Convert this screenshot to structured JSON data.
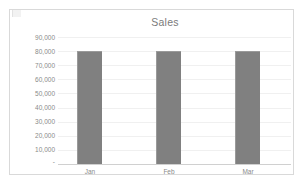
{
  "chart_data": {
    "type": "bar",
    "title": "Sales",
    "xlabel": "",
    "ylabel": "",
    "categories": [
      "Jan",
      "Feb",
      "Mar"
    ],
    "values": [
      80000,
      80000,
      80000
    ],
    "series": [
      {
        "name": "Sales",
        "values": [
          80000,
          80000,
          80000
        ]
      }
    ],
    "ylim": [
      0,
      90000
    ],
    "ytick_values": [
      90000,
      80000,
      70000,
      60000,
      50000,
      40000,
      30000,
      20000,
      10000,
      0
    ],
    "ytick_labels": [
      "90,000",
      "80,000",
      "70,000",
      "60,000",
      "50,000",
      "40,000",
      "30,000",
      "20,000",
      "10,000",
      "-"
    ],
    "grid": true,
    "legend": false,
    "legend_position": "none",
    "bar_color": "#808080",
    "gridline_color": "#f0f0f0",
    "axis_color": "#d0d0d0",
    "text_color": "#8a8a8a",
    "title_color": "#7a7a7a",
    "plot_background": "#ffffff",
    "border_color": "#d9d9d9"
  }
}
